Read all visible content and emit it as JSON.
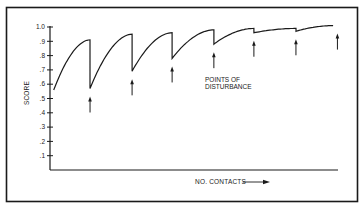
{
  "chart_data": {
    "type": "line",
    "title": "",
    "xlabel": "NO. CONTACTS",
    "ylabel": "SCORE",
    "ylim": [
      0,
      1.0
    ],
    "yticks": [
      ".1",
      ".2",
      ".3",
      ".4",
      ".5",
      ".6",
      ".7",
      ".8",
      ".9",
      "1.0"
    ],
    "ytick_values": [
      0.1,
      0.2,
      0.3,
      0.4,
      0.5,
      0.6,
      0.7,
      0.8,
      0.9,
      1.0
    ],
    "xticks": [],
    "grid": false,
    "legend": null,
    "annotation": {
      "line1": "POINTS OF",
      "line2": "DISTURBANCE"
    },
    "series": [
      {
        "name": "Score",
        "segments": [
          {
            "start_x": 0.013,
            "end_x": 0.139,
            "start_score": 0.56,
            "peak_score": 0.91,
            "drop_to": 0.57
          },
          {
            "start_x": 0.139,
            "end_x": 0.285,
            "start_score": 0.57,
            "peak_score": 0.95,
            "drop_to": 0.69
          },
          {
            "start_x": 0.285,
            "end_x": 0.424,
            "start_score": 0.69,
            "peak_score": 0.96,
            "drop_to": 0.78
          },
          {
            "start_x": 0.424,
            "end_x": 0.569,
            "start_score": 0.78,
            "peak_score": 0.98,
            "drop_to": 0.88
          },
          {
            "start_x": 0.569,
            "end_x": 0.708,
            "start_score": 0.88,
            "peak_score": 0.99,
            "drop_to": 0.96
          },
          {
            "start_x": 0.708,
            "end_x": 0.854,
            "start_score": 0.96,
            "peak_score": 0.99,
            "drop_to": 0.97
          },
          {
            "start_x": 0.854,
            "end_x": 0.983,
            "start_score": 0.97,
            "peak_score": 1.01,
            "drop_to": null
          }
        ]
      }
    ],
    "disturbance_points_x": [
      0.139,
      0.285,
      0.424,
      0.569,
      0.708,
      0.854,
      0.998
    ],
    "disturbance_count": 7
  },
  "colors": {
    "ink": "#1a1a1a",
    "background": "#ffffff"
  }
}
